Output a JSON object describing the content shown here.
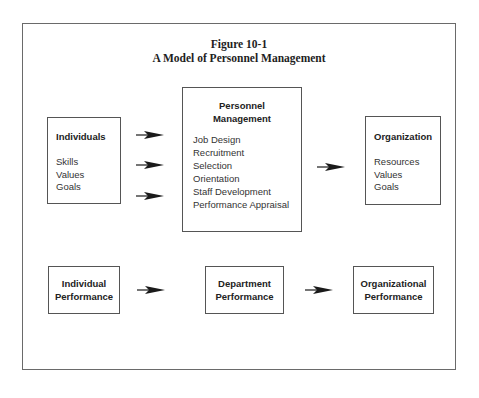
{
  "figure": {
    "number": "Figure 10-1",
    "title": "A Model of Personnel Management"
  },
  "top_row": {
    "individuals": {
      "heading": "Individuals",
      "items": [
        "Skills",
        "Values",
        "Goals"
      ]
    },
    "personnel_management": {
      "heading_line1": "Personnel",
      "heading_line2": "Management",
      "items": [
        "Job Design",
        "Recruitment",
        "Selection",
        "Orientation",
        "Staff Development",
        "Performance Appraisal"
      ]
    },
    "organization": {
      "heading": "Organization",
      "items": [
        "Resources",
        "Values",
        "Goals"
      ]
    }
  },
  "bottom_row": {
    "boxes": [
      {
        "line1": "Individual",
        "line2": "Performance"
      },
      {
        "line1": "Department",
        "line2": "Performance"
      },
      {
        "line1": "Organizational",
        "line2": "Performance"
      }
    ]
  },
  "colors": {
    "border": "#555555",
    "text": "#2a2a2a",
    "arrow": "#1a1a1a"
  }
}
